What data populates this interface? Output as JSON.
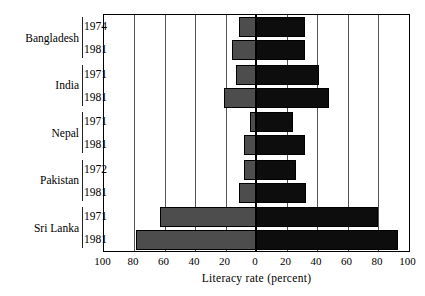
{
  "chart_data": {
    "type": "bar",
    "title": "",
    "subtitle": "",
    "orientation": "horizontal-diverging",
    "xlabel": "Literacy rate (percent)",
    "ylabel": "",
    "xlim": [
      -100,
      100
    ],
    "xticks": [
      100,
      80,
      60,
      40,
      20,
      0,
      20,
      40,
      60,
      80,
      100
    ],
    "grid": true,
    "legend_position": "none",
    "axis_note": "Left side values increase leftward from 0 to 100; right side values increase rightward from 0 to 100",
    "categories": [
      "Bangladesh 1974",
      "Bangladesh 1981",
      "India 1971",
      "India 1981",
      "Nepal 1971",
      "Nepal 1981",
      "Pakistan 1972",
      "Pakistan 1981",
      "Sri Lanka 1971",
      "Sri Lanka 1981"
    ],
    "series": [
      {
        "name": "left",
        "values": [
          11,
          16,
          13,
          21,
          4,
          8,
          8,
          11,
          63,
          79
        ]
      },
      {
        "name": "right",
        "values": [
          32,
          32,
          41,
          48,
          24,
          32,
          26,
          33,
          80,
          93
        ]
      }
    ],
    "groups": [
      {
        "name": "Bangladesh",
        "rows": [
          {
            "year": "1974",
            "left": 11,
            "right": 32
          },
          {
            "year": "1981",
            "left": 16,
            "right": 32
          }
        ]
      },
      {
        "name": "India",
        "rows": [
          {
            "year": "1971",
            "left": 13,
            "right": 41
          },
          {
            "year": "1981",
            "left": 21,
            "right": 48
          }
        ]
      },
      {
        "name": "Nepal",
        "rows": [
          {
            "year": "1971",
            "left": 4,
            "right": 24
          },
          {
            "year": "1981",
            "left": 8,
            "right": 32
          }
        ]
      },
      {
        "name": "Pakistan",
        "rows": [
          {
            "year": "1972",
            "left": 8,
            "right": 26
          },
          {
            "year": "1981",
            "left": 11,
            "right": 33
          }
        ]
      },
      {
        "name": "Sri Lanka",
        "rows": [
          {
            "year": "1971",
            "left": 63,
            "right": 80
          },
          {
            "year": "1981",
            "left": 79,
            "right": 93
          }
        ]
      }
    ],
    "colors": {
      "left_bar": "#4d4d4d",
      "right_bar": "#0d0d0d",
      "gridline": "#555555",
      "axis": "#000000",
      "background": "#ffffff"
    }
  }
}
